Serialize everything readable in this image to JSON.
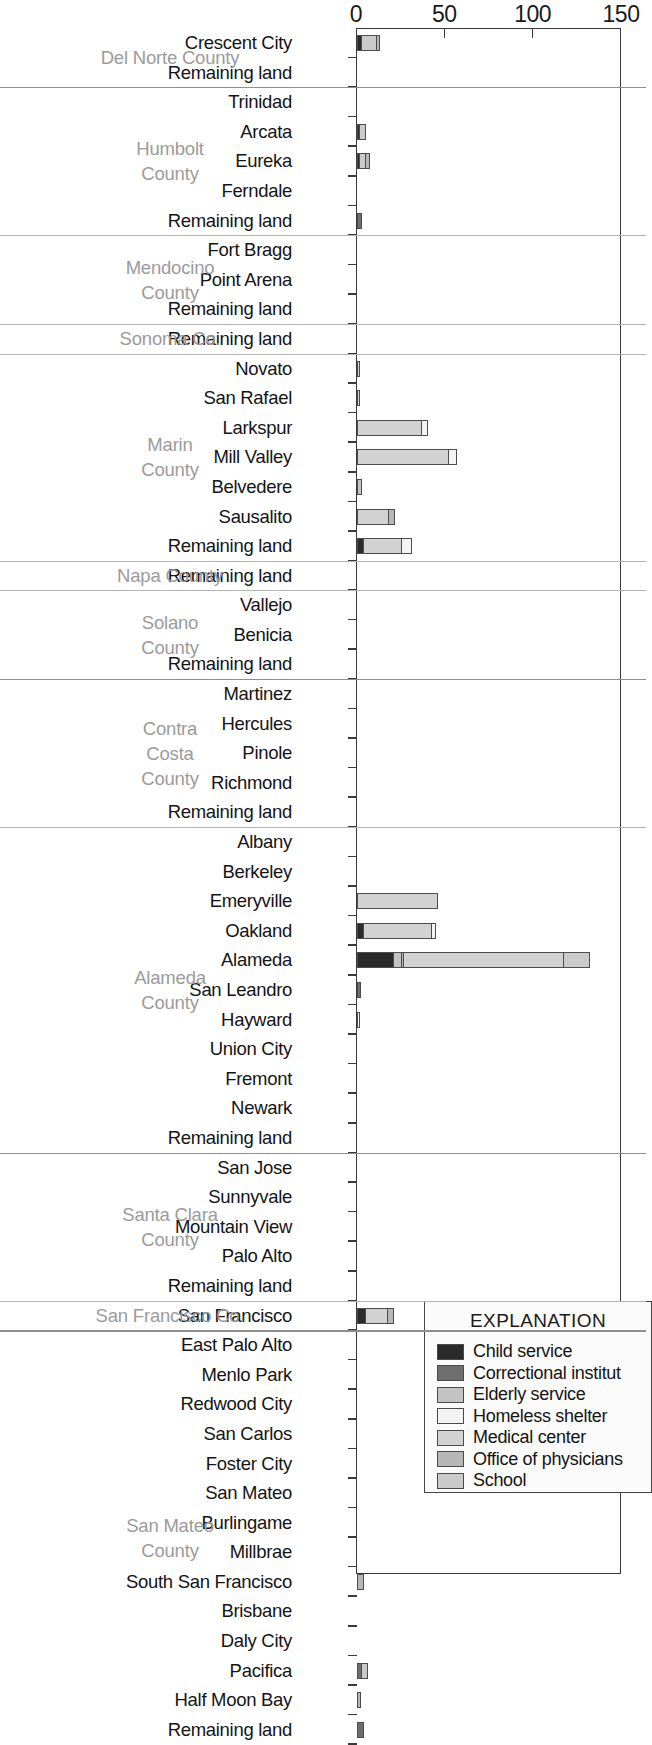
{
  "chart_data": {
    "type": "bar",
    "orientation": "horizontal",
    "title": "",
    "xlabel": "",
    "ylabel": "",
    "xlim": [
      0,
      150
    ],
    "xticks": [
      0,
      50,
      100,
      150
    ],
    "grid": false,
    "stacked": true,
    "legend_title": "EXPLANATION",
    "legend_position": "inside-bottom-right",
    "series": [
      {
        "name": "Child service",
        "color": "#2b2b2b"
      },
      {
        "name": "Correctional institut",
        "color": "#6e6e6e"
      },
      {
        "name": "Elderly service",
        "color": "#c3c3c3"
      },
      {
        "name": "Homeless shelter",
        "color": "#f4f4f4"
      },
      {
        "name": "Medical center",
        "color": "#d2d2d2"
      },
      {
        "name": "Office of physicians",
        "color": "#b7b7b7"
      },
      {
        "name": "School",
        "color": "#cacaca"
      }
    ],
    "groups": [
      {
        "county": "Del Norte County",
        "rows": [
          {
            "label": "Crescent City",
            "segments": [
              {
                "series": "Child service",
                "value": 3
              },
              {
                "series": "School",
                "value": 9
              },
              {
                "series": "Office of physicians",
                "value": 2
              }
            ]
          },
          {
            "label": "Remaining land",
            "segments": []
          }
        ]
      },
      {
        "county": "Humbolt County",
        "rows": [
          {
            "label": "Trinidad",
            "segments": []
          },
          {
            "label": "Arcata",
            "segments": [
              {
                "series": "Child service",
                "value": 1
              },
              {
                "series": "School",
                "value": 4
              }
            ]
          },
          {
            "label": "Eureka",
            "segments": [
              {
                "series": "Child service",
                "value": 1
              },
              {
                "series": "School",
                "value": 4
              },
              {
                "series": "Office of physicians",
                "value": 3
              }
            ]
          },
          {
            "label": "Ferndale",
            "segments": []
          },
          {
            "label": "Remaining land",
            "segments": [
              {
                "series": "Correctional institut",
                "value": 3
              }
            ]
          }
        ]
      },
      {
        "county": "Mendocino County",
        "rows": [
          {
            "label": "Fort Bragg",
            "segments": []
          },
          {
            "label": "Point Arena",
            "segments": []
          },
          {
            "label": "Remaining land",
            "segments": []
          }
        ]
      },
      {
        "county": "Sonoma Co.",
        "rows": [
          {
            "label": "Remaining land",
            "segments": []
          }
        ]
      },
      {
        "county": "Marin County",
        "rows": [
          {
            "label": "Novato",
            "segments": [
              {
                "series": "Medical center",
                "value": 1
              }
            ]
          },
          {
            "label": "San Rafael",
            "segments": [
              {
                "series": "Medical center",
                "value": 1
              }
            ]
          },
          {
            "label": "Larkspur",
            "segments": [
              {
                "series": "Medical center",
                "value": 37
              },
              {
                "series": "Homeless shelter",
                "value": 4
              }
            ]
          },
          {
            "label": "Mill Valley",
            "segments": [
              {
                "series": "Medical center",
                "value": 52
              },
              {
                "series": "Homeless shelter",
                "value": 5
              }
            ]
          },
          {
            "label": "Belvedere",
            "segments": [
              {
                "series": "Elderly service",
                "value": 3
              }
            ]
          },
          {
            "label": "Sausalito",
            "segments": [
              {
                "series": "Medical center",
                "value": 18
              },
              {
                "series": "Office of physicians",
                "value": 4
              }
            ]
          },
          {
            "label": "Remaining land",
            "segments": [
              {
                "series": "Child service",
                "value": 4
              },
              {
                "series": "Medical center",
                "value": 22
              },
              {
                "series": "Homeless shelter",
                "value": 6
              }
            ]
          }
        ]
      },
      {
        "county": "Napa County",
        "rows": [
          {
            "label": "Remaining land",
            "segments": []
          }
        ]
      },
      {
        "county": "Solano County",
        "rows": [
          {
            "label": "Vallejo",
            "segments": []
          },
          {
            "label": "Benicia",
            "segments": []
          },
          {
            "label": "Remaining land",
            "segments": []
          }
        ]
      },
      {
        "county": "Contra Costa County",
        "rows": [
          {
            "label": "Martinez",
            "segments": []
          },
          {
            "label": "Hercules",
            "segments": []
          },
          {
            "label": "Pinole",
            "segments": []
          },
          {
            "label": "Richmond",
            "segments": []
          },
          {
            "label": "Remaining land",
            "segments": []
          }
        ]
      },
      {
        "county": "Alameda County",
        "rows": [
          {
            "label": "Albany",
            "segments": []
          },
          {
            "label": "Berkeley",
            "segments": []
          },
          {
            "label": "Emeryville",
            "segments": [
              {
                "series": "Medical center",
                "value": 46
              }
            ]
          },
          {
            "label": "Oakland",
            "segments": [
              {
                "series": "Child service",
                "value": 4
              },
              {
                "series": "Medical center",
                "value": 39
              },
              {
                "series": "Homeless shelter",
                "value": 3
              }
            ]
          },
          {
            "label": "Alameda",
            "segments": [
              {
                "series": "Child service",
                "value": 21
              },
              {
                "series": "Elderly service",
                "value": 5
              },
              {
                "series": "Office of physicians",
                "value": 2
              },
              {
                "series": "Medical center",
                "value": 91
              },
              {
                "series": "School",
                "value": 15
              }
            ]
          },
          {
            "label": "San Leandro",
            "segments": [
              {
                "series": "Correctional institut",
                "value": 2
              }
            ]
          },
          {
            "label": "Hayward",
            "segments": [
              {
                "series": "Homeless shelter",
                "value": 1
              }
            ]
          },
          {
            "label": "Union City",
            "segments": []
          },
          {
            "label": "Fremont",
            "segments": []
          },
          {
            "label": "Newark",
            "segments": []
          },
          {
            "label": "Remaining land",
            "segments": []
          }
        ]
      },
      {
        "county": "Santa Clara County",
        "rows": [
          {
            "label": "San Jose",
            "segments": []
          },
          {
            "label": "Sunnyvale",
            "segments": []
          },
          {
            "label": "Mountain View",
            "segments": []
          },
          {
            "label": "Palo Alto",
            "segments": []
          },
          {
            "label": "Remaining land",
            "segments": []
          }
        ]
      },
      {
        "county": "San Francisco Co.",
        "rows": [
          {
            "label": "San Francisco",
            "segments": [
              {
                "series": "Child service",
                "value": 5
              },
              {
                "series": "Medical center",
                "value": 13
              },
              {
                "series": "Office of physicians",
                "value": 4
              }
            ]
          }
        ]
      },
      {
        "county": "San Mateo County",
        "rows": [
          {
            "label": "East Palo Alto",
            "segments": []
          },
          {
            "label": "Menlo Park",
            "segments": []
          },
          {
            "label": "Redwood City",
            "segments": []
          },
          {
            "label": "San Carlos",
            "segments": []
          },
          {
            "label": "Foster City",
            "segments": []
          },
          {
            "label": "San Mateo",
            "segments": []
          },
          {
            "label": "Burlingame",
            "segments": []
          },
          {
            "label": "Millbrae",
            "segments": []
          },
          {
            "label": "South San Francisco",
            "segments": [
              {
                "series": "Office of physicians",
                "value": 4
              }
            ]
          },
          {
            "label": "Brisbane",
            "segments": []
          },
          {
            "label": "Daly City",
            "segments": []
          },
          {
            "label": "Pacifica",
            "segments": [
              {
                "series": "Correctional institut",
                "value": 3
              },
              {
                "series": "School",
                "value": 4
              }
            ]
          },
          {
            "label": "Half Moon Bay",
            "segments": [
              {
                "series": "Office of physicians",
                "value": 2
              }
            ]
          },
          {
            "label": "Remaining land",
            "segments": [
              {
                "series": "Correctional institut",
                "value": 4
              }
            ]
          }
        ]
      }
    ]
  }
}
